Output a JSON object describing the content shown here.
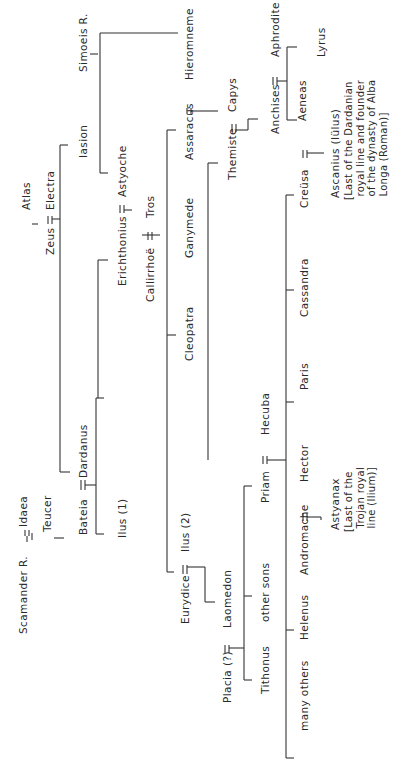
{
  "diagram": {
    "type": "genealogical-tree",
    "orientation": "rotated-90-ccw",
    "title": "",
    "people": [
      {
        "id": "scamander",
        "label": "Scamander R.",
        "x": 18,
        "y": 634
      },
      {
        "id": "idaea",
        "label": "Idaea",
        "x": 18,
        "y": 527
      },
      {
        "id": "teucer",
        "label": "Teucer",
        "x": 42,
        "y": 532
      },
      {
        "id": "bateia",
        "label": "Bateia",
        "x": 78,
        "y": 535
      },
      {
        "id": "dardanus",
        "label": "Dardanus",
        "x": 78,
        "y": 478
      },
      {
        "id": "atlas",
        "label": "Atlas",
        "x": 21,
        "y": 210
      },
      {
        "id": "zeus",
        "label": "Zeus",
        "x": 45,
        "y": 255
      },
      {
        "id": "electra",
        "label": "Electra",
        "x": 45,
        "y": 210
      },
      {
        "id": "iasion",
        "label": "Iasion",
        "x": 78,
        "y": 158
      },
      {
        "id": "simoeis",
        "label": "Simoeis R.",
        "x": 78,
        "y": 72
      },
      {
        "id": "ilus1",
        "label": "Ilus (1)",
        "x": 117,
        "y": 538
      },
      {
        "id": "erichthonius",
        "label": "Erichthonius",
        "x": 117,
        "y": 286
      },
      {
        "id": "astyoche",
        "label": "Astyoche",
        "x": 117,
        "y": 197
      },
      {
        "id": "callirrhoe",
        "label": "Callirrhoë",
        "x": 145,
        "y": 302
      },
      {
        "id": "tros",
        "label": "Tros",
        "x": 145,
        "y": 218
      },
      {
        "id": "eurydice",
        "label": "Eurydice",
        "x": 180,
        "y": 624
      },
      {
        "id": "ilus2",
        "label": "Ilus (2)",
        "x": 180,
        "y": 552
      },
      {
        "id": "cleopatra",
        "label": "Cleopatra",
        "x": 184,
        "y": 361
      },
      {
        "id": "ganymede",
        "label": "Ganymede",
        "x": 184,
        "y": 258
      },
      {
        "id": "assaracus",
        "label": "Assaracus",
        "x": 184,
        "y": 160
      },
      {
        "id": "hieromneme",
        "label": "Hieromneme",
        "x": 184,
        "y": 80
      },
      {
        "id": "placia",
        "label": "Placia (?)",
        "x": 222,
        "y": 703
      },
      {
        "id": "laomedon",
        "label": "Laomedon",
        "x": 222,
        "y": 628
      },
      {
        "id": "themiste",
        "label": "Themiste",
        "x": 227,
        "y": 180
      },
      {
        "id": "capys",
        "label": "Capys",
        "x": 227,
        "y": 112
      },
      {
        "id": "tithonus",
        "label": "Tithonus",
        "x": 260,
        "y": 694
      },
      {
        "id": "other-sons",
        "label": "other sons",
        "x": 260,
        "y": 622
      },
      {
        "id": "priam",
        "label": "Priam",
        "x": 260,
        "y": 503
      },
      {
        "id": "hecuba",
        "label": "Hecuba",
        "x": 260,
        "y": 435
      },
      {
        "id": "anchises",
        "label": "Anchises",
        "x": 270,
        "y": 134
      },
      {
        "id": "aphrodite",
        "label": "Aphrodite",
        "x": 270,
        "y": 57
      },
      {
        "id": "aeneas",
        "label": "Aeneas",
        "x": 297,
        "y": 121
      },
      {
        "id": "lyrus",
        "label": "Lyrus",
        "x": 316,
        "y": 57
      },
      {
        "id": "many-others",
        "label": "many others",
        "x": 299,
        "y": 731
      },
      {
        "id": "helenus",
        "label": "Helenus",
        "x": 299,
        "y": 640
      },
      {
        "id": "andromache",
        "label": "Andromache",
        "x": 299,
        "y": 575
      },
      {
        "id": "hector",
        "label": "Hector",
        "x": 299,
        "y": 482
      },
      {
        "id": "paris",
        "label": "Paris",
        "x": 299,
        "y": 390
      },
      {
        "id": "cassandra",
        "label": "Cassandra",
        "x": 299,
        "y": 317
      },
      {
        "id": "creusa",
        "label": "Creüsa",
        "x": 299,
        "y": 208
      },
      {
        "id": "astyanax",
        "label": "Astyanax",
        "x": 330,
        "y": 530
      },
      {
        "id": "ascanius",
        "label": "Ascanius (Iülus)",
        "x": 330,
        "y": 198
      }
    ],
    "notes": [
      {
        "id": "astyanax-note",
        "text": "[Last of the\n Trojan royal\n line (Ilium)]",
        "x": 343,
        "y": 532
      },
      {
        "id": "ascanius-note",
        "text": "[Last of the Dardanian\n royal line and founder\n of the dynasty of Alba\n Longa (Roman)]",
        "x": 343,
        "y": 200
      }
    ],
    "marriage_symbol": "="
  }
}
